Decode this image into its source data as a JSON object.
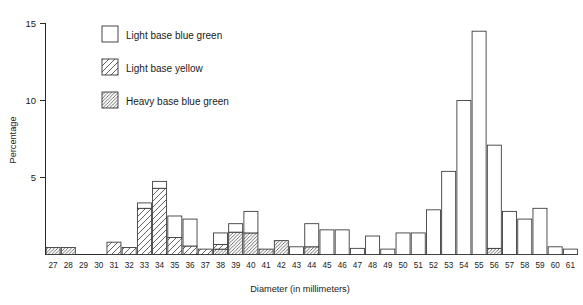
{
  "chart_data": {
    "type": "bar",
    "subtype": "stacked-histogram",
    "title": "",
    "xlabel": "Diameter  (in millimeters)",
    "ylabel": "Percentage",
    "xlim": [
      26.5,
      61.5
    ],
    "ylim": [
      0,
      15
    ],
    "yticks": [
      5,
      10,
      15
    ],
    "ytick_labels": [
      "5",
      "10",
      "15"
    ],
    "grid": false,
    "legend_position": "upper-left-inside",
    "categories": [
      27,
      28,
      29,
      30,
      31,
      32,
      33,
      34,
      35,
      36,
      37,
      38,
      39,
      40,
      41,
      42,
      43,
      44,
      45,
      46,
      47,
      48,
      49,
      50,
      51,
      52,
      53,
      54,
      55,
      56,
      57,
      58,
      59,
      60,
      61
    ],
    "xtick_labels": [
      "27",
      "28",
      "29",
      "30",
      "31",
      "32",
      "33",
      "34",
      "35",
      "36",
      "37",
      "38",
      "39",
      "40",
      "41",
      "42",
      "43",
      "44",
      "45",
      "46",
      "47",
      "48",
      "49",
      "50",
      "51",
      "52",
      "53",
      "54",
      "55",
      "56",
      "57",
      "58",
      "59",
      "60",
      "61"
    ],
    "series": [
      {
        "name": "Light base blue green",
        "fill": "white",
        "values": [
          0,
          0,
          0,
          0,
          0,
          0,
          0.35,
          0.45,
          1.4,
          1.75,
          0,
          0.75,
          0.55,
          1.4,
          0,
          0,
          0.5,
          1.5,
          1.6,
          1.6,
          0.4,
          1.2,
          0.35,
          1.4,
          1.4,
          2.9,
          5.4,
          10.0,
          14.5,
          6.7,
          2.8,
          2.3,
          3.0,
          0.5,
          0.35
        ]
      },
      {
        "name": "Light base yellow",
        "fill": "sparse-hatch",
        "values": [
          0,
          0,
          0,
          0,
          0.8,
          0.45,
          3.0,
          4.3,
          1.1,
          0.55,
          0.35,
          0.3,
          0,
          0,
          0,
          0,
          0,
          0,
          0,
          0,
          0,
          0,
          0,
          0,
          0,
          0,
          0,
          0,
          0,
          0,
          0,
          0,
          0,
          0,
          0
        ]
      },
      {
        "name": "Heavy base blue green",
        "fill": "dense-hatch",
        "values": [
          0.45,
          0.45,
          0,
          0,
          0,
          0,
          0,
          0,
          0,
          0,
          0,
          0.35,
          1.45,
          1.4,
          0.35,
          0.9,
          0,
          0.5,
          0,
          0,
          0,
          0,
          0,
          0,
          0,
          0,
          0,
          0,
          0,
          0.4,
          0,
          0,
          0,
          0,
          0
        ]
      }
    ],
    "stack_order": [
      "Heavy base blue green",
      "Light base yellow",
      "Light base blue green"
    ],
    "totals": [
      0.45,
      0.45,
      0,
      0,
      0.8,
      0.45,
      3.35,
      4.75,
      2.5,
      2.3,
      0.35,
      1.4,
      2.0,
      2.8,
      0.35,
      0.9,
      0.5,
      2.0,
      1.6,
      1.6,
      0.4,
      1.2,
      0.35,
      1.4,
      1.4,
      2.9,
      5.4,
      10.0,
      14.5,
      7.1,
      2.8,
      2.3,
      3.0,
      0.5,
      0.35
    ]
  },
  "legend": {
    "items": [
      {
        "label": "Light base blue green",
        "pattern": "white"
      },
      {
        "label": "Light base yellow",
        "pattern": "sparse-hatch"
      },
      {
        "label": "Heavy base blue green",
        "pattern": "dense-hatch"
      }
    ]
  },
  "axes": {
    "y_label": "Percentage",
    "x_label": "Diameter  (in millimeters)",
    "y_tick_0": "15",
    "y_tick_1": "10",
    "y_tick_2": "5"
  },
  "colors": {
    "ink": "#1a1a1a",
    "axis": "#2b2b2b",
    "bar_stroke": "#333333",
    "bar_fill": "#ffffff",
    "background": "#ffffff"
  }
}
